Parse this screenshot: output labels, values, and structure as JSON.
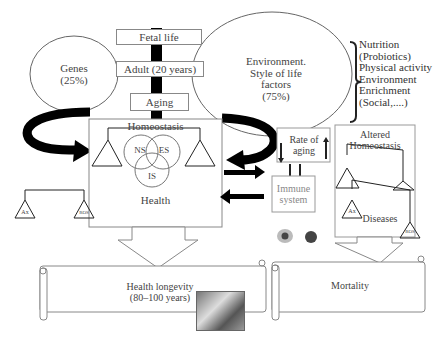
{
  "diagram": {
    "timeline": {
      "stages": [
        "Fetal life",
        "Adult (20 years)",
        "Aging"
      ]
    },
    "genes": {
      "label": "Genes",
      "percent": "(25%)"
    },
    "environment": {
      "line1": "Environment.",
      "line2": "Style of life",
      "line3": "factors",
      "percent": "(75%)"
    },
    "lifestyle_factors": [
      "Nutrition",
      "(Probiotics)",
      "Physical activity",
      "Environment",
      "Enrichment",
      "(Social,....)"
    ],
    "homeostasis": {
      "title": "Homeostasis",
      "systems": [
        "NS",
        "ES",
        "IS"
      ],
      "footer": "Health"
    },
    "left_balance": {
      "left": "Ax",
      "right": "ROS"
    },
    "rate_of_aging": {
      "line1": "Rate of",
      "line2": "aging"
    },
    "immune_system": {
      "line1": "Immune",
      "line2": "system"
    },
    "altered_homeostasis": {
      "line1": "Altered",
      "line2": "Homeostasis",
      "balance_left": "Ax",
      "balance_right": "ROS",
      "footer": "Diseases"
    },
    "outcomes": {
      "health_longevity": {
        "line1": "Health longevity",
        "line2": "(80–100 years)"
      },
      "mortality": "Mortality"
    }
  }
}
